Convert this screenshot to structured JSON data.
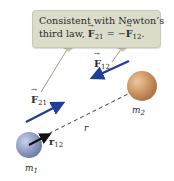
{
  "callout": {
    "line1": "Consistent with Newton’s",
    "line2_prefix": "third law, ",
    "line2_F": "F",
    "line2_sub1": "21",
    "line2_eq": " = −",
    "line2_F2": "F",
    "line2_sub2": "12",
    "line2_end": "."
  },
  "labels": {
    "F12": {
      "base": "F",
      "sub": "12"
    },
    "F21": {
      "base": "F",
      "sub": "21"
    },
    "r": "r",
    "r12_hat": {
      "base": "r",
      "sub": "12"
    },
    "m1": {
      "base": "m",
      "sub": "1"
    },
    "m2": {
      "base": "m",
      "sub": "2"
    }
  },
  "colors": {
    "callout_bg": "#dcdccb",
    "force_arrow": "#1f3f9a",
    "mass1": "#8e9cc4",
    "mass2": "#c9915f",
    "leader_line": "#9a9a86"
  }
}
